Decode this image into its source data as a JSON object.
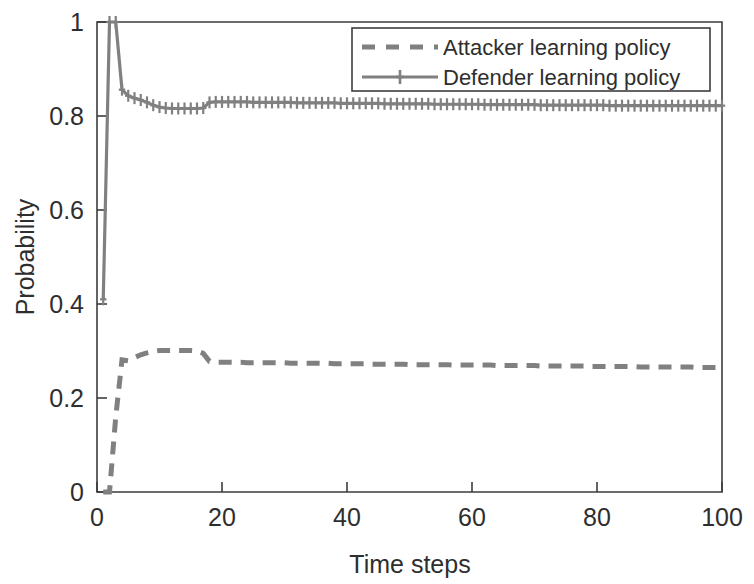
{
  "chart_data": {
    "type": "line",
    "title": "",
    "xlabel": "Time steps",
    "ylabel": "Probability",
    "xlim": [
      0,
      100
    ],
    "ylim": [
      0,
      1
    ],
    "xticks": [
      0,
      20,
      40,
      60,
      80,
      100
    ],
    "yticks": [
      0,
      0.2,
      0.4,
      0.6,
      0.8,
      1
    ],
    "xtick_labels": [
      "0",
      "20",
      "40",
      "60",
      "80",
      "100"
    ],
    "ytick_labels": [
      "0",
      "0.2",
      "0.4",
      "0.6",
      "0.8",
      "1"
    ],
    "grid": false,
    "legend_position": "top-right",
    "colors": {
      "attacker": "#808080",
      "defender": "#808080",
      "axis": "#3d3d3d",
      "text": "#2e2e2e",
      "background": "#ffffff"
    },
    "series": [
      {
        "name": "Attacker learning policy",
        "style": "dashed",
        "marker": "none",
        "color": "#808080",
        "x": [
          1,
          2,
          3,
          4,
          5,
          6,
          7,
          8,
          9,
          10,
          11,
          12,
          13,
          14,
          15,
          16,
          17,
          18,
          19,
          20,
          21,
          22,
          23,
          24,
          25,
          26,
          27,
          28,
          29,
          30,
          31,
          32,
          33,
          34,
          35,
          36,
          37,
          38,
          39,
          40,
          41,
          42,
          43,
          44,
          45,
          46,
          47,
          48,
          49,
          50,
          51,
          52,
          53,
          54,
          55,
          56,
          57,
          58,
          59,
          60,
          61,
          62,
          63,
          64,
          65,
          66,
          67,
          68,
          69,
          70,
          71,
          72,
          73,
          74,
          75,
          76,
          77,
          78,
          79,
          80,
          81,
          82,
          83,
          84,
          85,
          86,
          87,
          88,
          89,
          90,
          91,
          92,
          93,
          94,
          95,
          96,
          97,
          98,
          99,
          100
        ],
        "values": [
          0.0,
          0.0,
          0.16,
          0.281,
          0.279,
          0.286,
          0.292,
          0.296,
          0.299,
          0.301,
          0.301,
          0.301,
          0.301,
          0.301,
          0.301,
          0.3,
          0.295,
          0.278,
          0.276,
          0.276,
          0.276,
          0.276,
          0.276,
          0.275,
          0.275,
          0.275,
          0.275,
          0.275,
          0.275,
          0.275,
          0.274,
          0.274,
          0.274,
          0.274,
          0.274,
          0.274,
          0.274,
          0.273,
          0.273,
          0.273,
          0.273,
          0.273,
          0.273,
          0.272,
          0.272,
          0.272,
          0.272,
          0.272,
          0.272,
          0.271,
          0.271,
          0.271,
          0.271,
          0.271,
          0.271,
          0.271,
          0.27,
          0.27,
          0.27,
          0.27,
          0.27,
          0.27,
          0.27,
          0.269,
          0.269,
          0.269,
          0.269,
          0.269,
          0.269,
          0.269,
          0.268,
          0.268,
          0.268,
          0.268,
          0.268,
          0.268,
          0.268,
          0.268,
          0.267,
          0.267,
          0.267,
          0.267,
          0.267,
          0.267,
          0.267,
          0.267,
          0.266,
          0.266,
          0.266,
          0.266,
          0.266,
          0.266,
          0.266,
          0.266,
          0.266,
          0.265,
          0.265,
          0.265,
          0.265,
          0.265
        ]
      },
      {
        "name": "Defender learning policy",
        "style": "solid",
        "marker": "plus",
        "color": "#808080",
        "x": [
          1,
          2,
          3,
          4,
          5,
          6,
          7,
          8,
          9,
          10,
          11,
          12,
          13,
          14,
          15,
          16,
          17,
          18,
          19,
          20,
          21,
          22,
          23,
          24,
          25,
          26,
          27,
          28,
          29,
          30,
          31,
          32,
          33,
          34,
          35,
          36,
          37,
          38,
          39,
          40,
          41,
          42,
          43,
          44,
          45,
          46,
          47,
          48,
          49,
          50,
          51,
          52,
          53,
          54,
          55,
          56,
          57,
          58,
          59,
          60,
          61,
          62,
          63,
          64,
          65,
          66,
          67,
          68,
          69,
          70,
          71,
          72,
          73,
          74,
          75,
          76,
          77,
          78,
          79,
          80,
          81,
          82,
          83,
          84,
          85,
          86,
          87,
          88,
          89,
          90,
          91,
          92,
          93,
          94,
          95,
          96,
          97,
          98,
          99,
          100
        ],
        "values": [
          0.41,
          1.0,
          1.0,
          0.856,
          0.843,
          0.838,
          0.834,
          0.829,
          0.823,
          0.819,
          0.817,
          0.816,
          0.816,
          0.816,
          0.816,
          0.816,
          0.817,
          0.829,
          0.83,
          0.83,
          0.83,
          0.83,
          0.83,
          0.83,
          0.829,
          0.829,
          0.829,
          0.829,
          0.829,
          0.829,
          0.829,
          0.828,
          0.828,
          0.828,
          0.828,
          0.828,
          0.828,
          0.828,
          0.827,
          0.827,
          0.827,
          0.827,
          0.827,
          0.827,
          0.827,
          0.826,
          0.826,
          0.826,
          0.826,
          0.826,
          0.826,
          0.826,
          0.826,
          0.825,
          0.825,
          0.825,
          0.825,
          0.825,
          0.825,
          0.825,
          0.825,
          0.824,
          0.824,
          0.824,
          0.824,
          0.824,
          0.824,
          0.824,
          0.824,
          0.824,
          0.823,
          0.823,
          0.823,
          0.823,
          0.823,
          0.823,
          0.823,
          0.823,
          0.823,
          0.823,
          0.823,
          0.822,
          0.822,
          0.822,
          0.822,
          0.822,
          0.822,
          0.822,
          0.822,
          0.822,
          0.822,
          0.822,
          0.822,
          0.822,
          0.822,
          0.822,
          0.822,
          0.822,
          0.822,
          0.822
        ]
      }
    ]
  },
  "legend": {
    "entries": [
      {
        "label": "Attacker learning policy"
      },
      {
        "label": "Defender learning policy"
      }
    ]
  },
  "axes": {
    "x_title": "Time steps",
    "y_title": "Probability",
    "x_ticks": [
      "0",
      "20",
      "40",
      "60",
      "80",
      "100"
    ],
    "y_ticks": [
      "0",
      "0.2",
      "0.4",
      "0.6",
      "0.8",
      "1"
    ]
  }
}
